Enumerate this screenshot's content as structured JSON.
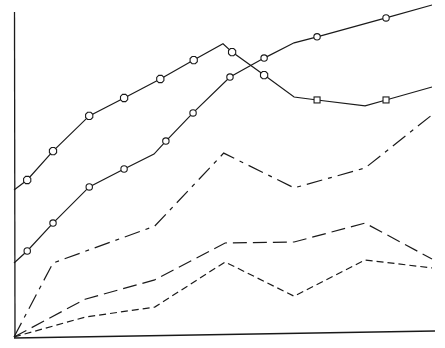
{
  "chart_data": {
    "type": "line",
    "title": "",
    "xlabel": "",
    "ylabel": "",
    "xlim": [
      0,
      6
    ],
    "ylim": [
      0,
      100
    ],
    "grid": false,
    "legend": "none",
    "series": [
      {
        "name": "series-1",
        "line_style": "solid",
        "marker": "diamond-then-square",
        "points": [
          {
            "x": 0.0,
            "y": 44.3,
            "marker": "none"
          },
          {
            "x": 0.19,
            "y": 47.3,
            "marker": "diamond"
          },
          {
            "x": 0.56,
            "y": 56.0,
            "marker": "diamond"
          },
          {
            "x": 1.08,
            "y": 66.6,
            "marker": "diamond"
          },
          {
            "x": 1.58,
            "y": 72.0,
            "marker": "diamond"
          },
          {
            "x": 2.1,
            "y": 77.7,
            "marker": "diamond"
          },
          {
            "x": 2.58,
            "y": 83.4,
            "marker": "diamond"
          },
          {
            "x": 3.0,
            "y": 88.3,
            "marker": "none"
          },
          {
            "x": 3.13,
            "y": 85.8,
            "marker": "diamond"
          },
          {
            "x": 3.59,
            "y": 78.9,
            "marker": "diamond"
          },
          {
            "x": 4.02,
            "y": 72.3,
            "marker": "none"
          },
          {
            "x": 4.35,
            "y": 71.4,
            "marker": "square"
          },
          {
            "x": 5.04,
            "y": 69.6,
            "marker": "none"
          },
          {
            "x": 5.34,
            "y": 71.4,
            "marker": "square"
          },
          {
            "x": 6.0,
            "y": 75.3,
            "marker": "none"
          }
        ]
      },
      {
        "name": "series-2",
        "line_style": "solid",
        "marker": "circle",
        "points": [
          {
            "x": 0.0,
            "y": 22.3,
            "marker": "none"
          },
          {
            "x": 0.19,
            "y": 25.9,
            "marker": "circle"
          },
          {
            "x": 0.56,
            "y": 34.3,
            "marker": "circle"
          },
          {
            "x": 1.08,
            "y": 45.2,
            "marker": "circle"
          },
          {
            "x": 1.58,
            "y": 50.6,
            "marker": "circle"
          },
          {
            "x": 2.01,
            "y": 55.1,
            "marker": "none"
          },
          {
            "x": 2.18,
            "y": 59.0,
            "marker": "circle"
          },
          {
            "x": 2.57,
            "y": 67.5,
            "marker": "circle"
          },
          {
            "x": 3.1,
            "y": 78.3,
            "marker": "circle"
          },
          {
            "x": 3.59,
            "y": 84.0,
            "marker": "circle"
          },
          {
            "x": 4.02,
            "y": 88.6,
            "marker": "none"
          },
          {
            "x": 4.35,
            "y": 90.4,
            "marker": "circle"
          },
          {
            "x": 5.34,
            "y": 96.1,
            "marker": "circle"
          },
          {
            "x": 6.0,
            "y": 100.0,
            "marker": "none"
          }
        ]
      },
      {
        "name": "series-3",
        "line_style": "dash-dot",
        "marker": "none",
        "points": [
          {
            "x": 0.0,
            "y": 0.0
          },
          {
            "x": 0.56,
            "y": 22.3
          },
          {
            "x": 2.02,
            "y": 33.4
          },
          {
            "x": 3.01,
            "y": 55.4
          },
          {
            "x": 4.02,
            "y": 44.9
          },
          {
            "x": 5.04,
            "y": 50.9
          },
          {
            "x": 6.0,
            "y": 66.9
          }
        ]
      },
      {
        "name": "series-4",
        "line_style": "long-dash",
        "marker": "none",
        "points": [
          {
            "x": 0.0,
            "y": 0.0
          },
          {
            "x": 1.02,
            "y": 11.4
          },
          {
            "x": 2.02,
            "y": 17.2
          },
          {
            "x": 3.03,
            "y": 28.3
          },
          {
            "x": 4.02,
            "y": 28.6
          },
          {
            "x": 5.04,
            "y": 34.3
          },
          {
            "x": 6.0,
            "y": 23.5
          }
        ]
      },
      {
        "name": "series-5",
        "line_style": "short-dash",
        "marker": "none",
        "points": [
          {
            "x": 0.0,
            "y": 0.0
          },
          {
            "x": 1.02,
            "y": 6.0
          },
          {
            "x": 2.02,
            "y": 9.0
          },
          {
            "x": 3.03,
            "y": 22.6
          },
          {
            "x": 4.02,
            "y": 12.3
          },
          {
            "x": 5.04,
            "y": 23.2
          },
          {
            "x": 6.0,
            "y": 20.8
          }
        ]
      }
    ]
  }
}
